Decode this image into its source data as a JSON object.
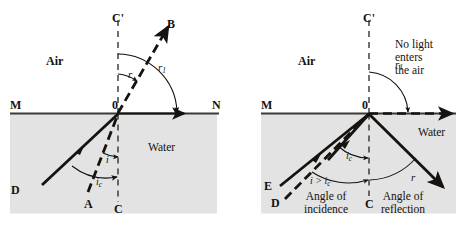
{
  "figure": {
    "width": 457,
    "height": 227,
    "colors": {
      "water_fill": "#e3e3e3",
      "ink": "#15120f",
      "page_background": "#ffffff"
    }
  },
  "left_panel": {
    "name": "refraction-at-critical-angle",
    "media": {
      "upper_label": "Air",
      "lower_label": "Water"
    },
    "surface": {
      "left_label": "M",
      "origin_label": "0",
      "right_label": "N"
    },
    "normal": {
      "above_label": "C'",
      "below_label": "C"
    },
    "rays": [
      {
        "name": "incident-ray-solid",
        "from": "D",
        "to": "0",
        "style": "solid"
      },
      {
        "name": "incident-ray-dashed",
        "from": "A",
        "to": "0",
        "style": "dashed"
      },
      {
        "name": "refracted-ray-dashed",
        "from": "0",
        "to": "B",
        "style": "dashed"
      },
      {
        "name": "grazing-ray-solid",
        "from": "0",
        "to": "N",
        "style": "solid"
      }
    ],
    "ray_labels": {
      "D": "D",
      "A": "A",
      "B": "B"
    },
    "angles": [
      {
        "name": "angle-i",
        "label": "i",
        "region": "water",
        "meaning": "angle of incidence"
      },
      {
        "name": "angle-ic",
        "label": "ic",
        "label_main": "i",
        "label_sub": "c",
        "region": "water",
        "meaning": "critical angle"
      },
      {
        "name": "angle-r",
        "label": "r",
        "region": "air",
        "meaning": "angle of refraction"
      },
      {
        "name": "angle-r1",
        "label": "r1",
        "label_main": "r",
        "label_sub": "1",
        "region": "air",
        "meaning": "refraction at 90 degrees"
      }
    ]
  },
  "right_panel": {
    "name": "total-internal-reflection",
    "media": {
      "upper_label": "Air",
      "lower_label": "Water"
    },
    "surface": {
      "left_label": "M",
      "origin_label": "0"
    },
    "normal": {
      "above_label": "C'",
      "below_label": "C"
    },
    "note": "No light\nenters\nthe air",
    "rays": [
      {
        "name": "incident-ray-solid",
        "from": "E",
        "to": "0",
        "style": "solid"
      },
      {
        "name": "incident-ray-dashed",
        "from": "D",
        "to": "0",
        "style": "dashed"
      },
      {
        "name": "critical-ray-solid",
        "from": "0",
        "to": "critical",
        "style": "solid"
      },
      {
        "name": "grazing-ray-dashed",
        "from": "0",
        "to": "right",
        "style": "dashed"
      },
      {
        "name": "reflected-ray-solid",
        "from": "0",
        "to": "bottom-right",
        "style": "solid"
      }
    ],
    "ray_labels": {
      "E": "E",
      "D": "D"
    },
    "angles": [
      {
        "name": "angle-ic",
        "label": "ic",
        "label_main": "i",
        "label_sub": "c",
        "region": "water",
        "meaning": "critical angle"
      },
      {
        "name": "angle-r1",
        "label": "r1",
        "label_main": "r",
        "label_sub": "1",
        "region": "air",
        "meaning": "grazing emergence"
      },
      {
        "name": "angle-r",
        "label": "r",
        "region": "water",
        "meaning": "angle of reflection"
      }
    ],
    "annotations": {
      "incidence_condition": "i > ic",
      "incidence_condition_main": "i > i",
      "incidence_condition_sub": "c",
      "incidence_caption": "Angle of\nincidence",
      "reflection_caption": "Angle of\nreflection"
    }
  }
}
